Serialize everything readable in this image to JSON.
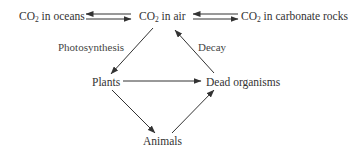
{
  "diagram": {
    "nodes": {
      "co2_oceans": {
        "prefix": "CO",
        "sub": "2",
        "suffix": " in oceans"
      },
      "co2_air": {
        "prefix": "CO",
        "sub": "2",
        "suffix": " in air"
      },
      "co2_rocks": {
        "prefix": "CO",
        "sub": "2",
        "suffix": " in carbonate rocks"
      },
      "plants": {
        "label": "Plants"
      },
      "dead": {
        "label": "Dead organisms"
      },
      "animals": {
        "label": "Animals"
      }
    },
    "edge_labels": {
      "photosynthesis": "Photosynthesis",
      "decay": "Decay"
    },
    "edges": [
      {
        "from": "co2_air",
        "to": "co2_oceans"
      },
      {
        "from": "co2_oceans",
        "to": "co2_air"
      },
      {
        "from": "co2_rocks",
        "to": "co2_air"
      },
      {
        "from": "co2_air",
        "to": "co2_rocks"
      },
      {
        "from": "co2_air",
        "to": "plants",
        "label": "Photosynthesis"
      },
      {
        "from": "dead",
        "to": "co2_air",
        "label": "Decay"
      },
      {
        "from": "plants",
        "to": "dead"
      },
      {
        "from": "plants",
        "to": "animals"
      },
      {
        "from": "animals",
        "to": "dead"
      }
    ],
    "colors": {
      "line": "#333333",
      "text": "#333333"
    }
  }
}
